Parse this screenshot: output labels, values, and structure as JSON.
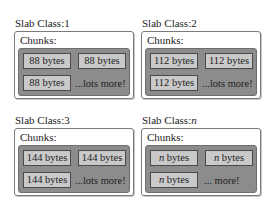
{
  "slabs": [
    {
      "title_prefix": "Slab Class:",
      "title_value": "1",
      "chunks_label": "Chunks:",
      "chunk_size": "88",
      "chunk_unit": " bytes",
      "chunks": [
        "88 bytes",
        "88 bytes",
        "88 bytes"
      ],
      "more_text": "...lots more!"
    },
    {
      "title_prefix": "Slab Class:",
      "title_value": "2",
      "chunks_label": "Chunks:",
      "chunk_size": "112",
      "chunk_unit": " bytes",
      "chunks": [
        "112 bytes",
        "112 bytes",
        "112 bytes"
      ],
      "more_text": "...lots more!"
    },
    {
      "title_prefix": "Slab Class:",
      "title_value": "3",
      "chunks_label": "Chunks:",
      "chunk_size": "144",
      "chunk_unit": " bytes",
      "chunks": [
        "144 bytes",
        "144 bytes",
        "144 bytes"
      ],
      "more_text": "...lots more!"
    },
    {
      "title_prefix": "Slab Class:",
      "title_value": "n",
      "chunks_label": "Chunks:",
      "chunk_size": "n",
      "chunk_unit": " bytes",
      "chunks": [
        "n bytes",
        "n bytes",
        "n bytes"
      ],
      "more_text": "... more!"
    }
  ],
  "colors": {
    "outer_border": "#7a7a7a",
    "chunks_area_fill": "#8c8c8c",
    "chunk_fill": "#c9c9c9",
    "chunk_border": "#4a4a4a"
  }
}
